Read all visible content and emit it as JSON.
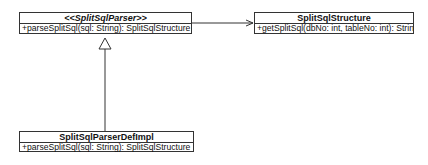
{
  "diagram": {
    "type": "uml-class-diagram",
    "classes": [
      {
        "id": "parser",
        "name": "<<SplitSqlParser>>",
        "stereotype_style": "italic",
        "operations": [
          "+parseSplitSql(sql: String): SplitSqlStructure"
        ]
      },
      {
        "id": "structure",
        "name": "SplitSqlStructure",
        "operations": [
          "+getSplitSql(dbNo: int, tableNo: int): String"
        ]
      },
      {
        "id": "impl",
        "name": "SplitSqlParserDefImpl",
        "operations": [
          "+parseSplitSql(sql: String): SplitSqlStructure"
        ]
      }
    ],
    "relations": [
      {
        "from": "parser",
        "to": "structure",
        "kind": "association",
        "arrow": "open"
      },
      {
        "from": "impl",
        "to": "parser",
        "kind": "realization",
        "arrow": "hollow-triangle"
      }
    ],
    "colors": {
      "line": "#333333",
      "background": "#ffffff",
      "text": "#111111"
    }
  }
}
